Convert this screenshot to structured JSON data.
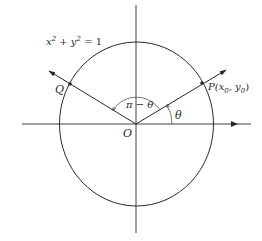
{
  "diagram": {
    "equation": {
      "base": "x² + y² = 1",
      "x": "x",
      "y": "y",
      "exp": "2",
      "plus": " + ",
      "eq": " = 1"
    },
    "labels": {
      "origin": "O",
      "point_p": "P(x",
      "point_p_sub0": "0",
      "point_p_mid": ", y",
      "point_p_sub1": "0",
      "point_p_close": ")",
      "point_q": "Q",
      "angle_theta": "θ",
      "angle_pi_minus_theta": "π − θ"
    },
    "colors": {
      "stroke": "#2a2a2a",
      "background": "#ffffff"
    }
  }
}
